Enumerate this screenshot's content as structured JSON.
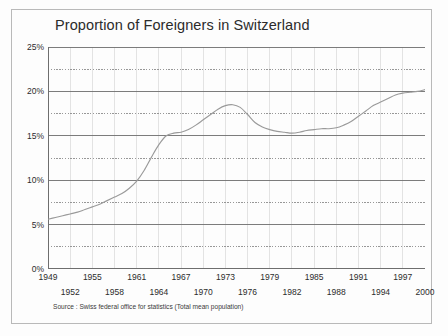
{
  "chart_data": {
    "type": "line",
    "title": "Proportion of Foreigners in Switzerland",
    "xlabel": "",
    "ylabel": "",
    "xlim": [
      1949,
      2000
    ],
    "ylim": [
      0,
      25
    ],
    "grid": true,
    "legend": "none",
    "y_tick_labels": [
      "0%",
      "5%",
      "10%",
      "15%",
      "20%",
      "25%"
    ],
    "y_tick_values": [
      0,
      5,
      10,
      15,
      20,
      25
    ],
    "y_minor_values": [
      2.5,
      7.5,
      12.5,
      17.5,
      22.5
    ],
    "x_tick_labels_top": [
      "1949",
      "1955",
      "1961",
      "1967",
      "1973",
      "1979",
      "1985",
      "1991",
      "1997"
    ],
    "x_tick_values_top": [
      1949,
      1955,
      1961,
      1967,
      1973,
      1979,
      1985,
      1991,
      1997
    ],
    "x_tick_labels_bottom": [
      "1952",
      "1958",
      "1964",
      "1970",
      "1976",
      "1982",
      "1988",
      "1994",
      "2000"
    ],
    "x_tick_values_bottom": [
      1952,
      1958,
      1964,
      1970,
      1976,
      1982,
      1988,
      1994,
      2000
    ],
    "series": [
      {
        "name": "Proportion of foreigners",
        "color": "#9a9a9a",
        "x": [
          1949,
          1950,
          1951,
          1952,
          1953,
          1954,
          1955,
          1956,
          1957,
          1958,
          1959,
          1960,
          1961,
          1962,
          1963,
          1964,
          1965,
          1966,
          1967,
          1968,
          1969,
          1970,
          1971,
          1972,
          1973,
          1974,
          1975,
          1976,
          1977,
          1978,
          1979,
          1980,
          1981,
          1982,
          1983,
          1984,
          1985,
          1986,
          1987,
          1988,
          1989,
          1990,
          1991,
          1992,
          1993,
          1994,
          1995,
          1996,
          1997,
          1998,
          1999,
          2000
        ],
        "y": [
          5.6,
          5.8,
          6.0,
          6.2,
          6.4,
          6.7,
          7.0,
          7.3,
          7.7,
          8.1,
          8.5,
          9.1,
          9.9,
          11.1,
          12.6,
          14.0,
          15.0,
          15.3,
          15.4,
          15.7,
          16.2,
          16.8,
          17.4,
          18.0,
          18.4,
          18.5,
          18.2,
          17.4,
          16.5,
          16.0,
          15.7,
          15.5,
          15.4,
          15.3,
          15.4,
          15.6,
          15.7,
          15.8,
          15.8,
          15.9,
          16.2,
          16.6,
          17.2,
          17.8,
          18.4,
          18.8,
          19.2,
          19.6,
          19.8,
          19.9,
          20.0,
          20.2
        ]
      }
    ],
    "source_note": "Source : Swiss federal office for statistics (Total mean population)"
  },
  "colors": {
    "frame": "#b9b9b9",
    "major_grid": "#6e6e6e",
    "minor_grid": "#8c8c8c",
    "vertical_grid": "#d7d7d7",
    "line": "#9a9a9a",
    "text": "#2c2c2c",
    "background": "#fdfdfd"
  }
}
